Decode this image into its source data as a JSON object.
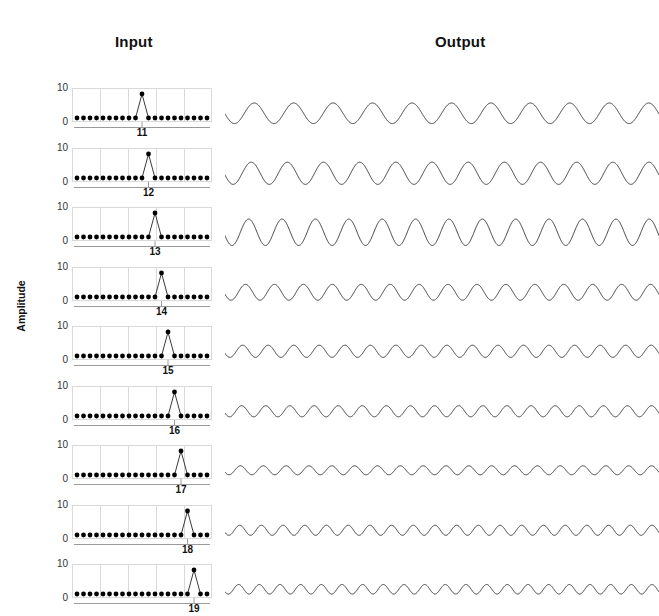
{
  "figure": {
    "width": 659,
    "height": 582,
    "background": "#ffffff",
    "line_color": "#3a3a3a",
    "marker_color": "#000000",
    "grid_color": "#d9d9d9",
    "axis_color": "#9a9a9a"
  },
  "headers": {
    "input": "Input",
    "output": "Output"
  },
  "axis": {
    "ylabel": "Amplitude",
    "yticks": [
      "10",
      "0"
    ],
    "ymin": 0,
    "ymax": 10
  },
  "chart_data": {
    "type": "line",
    "title": "",
    "subtitle": "",
    "xlabel": "",
    "ylabel": "Amplitude",
    "ylim": [
      0,
      10
    ],
    "grid": true,
    "legend": null,
    "n_rows": 9,
    "input_n_samples": 21,
    "input_baseline_value": 0,
    "input_spike_value": 10,
    "rows": [
      {
        "xtick_label": "11",
        "spike_index": 10,
        "input_values": [
          0,
          0,
          0,
          0,
          0,
          0,
          0,
          0,
          0,
          0,
          10,
          0,
          0,
          0,
          0,
          0,
          0,
          0,
          0,
          0,
          0
        ],
        "output": {
          "cycles": 11.0,
          "amplitude": 0.78,
          "phase": 3.2
        }
      },
      {
        "xtick_label": "12",
        "spike_index": 11,
        "input_values": [
          0,
          0,
          0,
          0,
          0,
          0,
          0,
          0,
          0,
          0,
          0,
          10,
          0,
          0,
          0,
          0,
          0,
          0,
          0,
          0,
          0
        ],
        "output": {
          "cycles": 12.0,
          "amplitude": 0.84,
          "phase": 3.3
        }
      },
      {
        "xtick_label": "13",
        "spike_index": 12,
        "input_values": [
          0,
          0,
          0,
          0,
          0,
          0,
          0,
          0,
          0,
          0,
          0,
          0,
          10,
          0,
          0,
          0,
          0,
          0,
          0,
          0,
          0
        ],
        "output": {
          "cycles": 13.0,
          "amplitude": 1.0,
          "phase": 3.4
        }
      },
      {
        "xtick_label": "14",
        "spike_index": 13,
        "input_values": [
          0,
          0,
          0,
          0,
          0,
          0,
          0,
          0,
          0,
          0,
          0,
          0,
          0,
          10,
          0,
          0,
          0,
          0,
          0,
          0,
          0
        ],
        "output": {
          "cycles": 15.0,
          "amplitude": 0.6,
          "phase": 3.4
        }
      },
      {
        "xtick_label": "15",
        "spike_index": 14,
        "input_values": [
          0,
          0,
          0,
          0,
          0,
          0,
          0,
          0,
          0,
          0,
          0,
          0,
          0,
          0,
          10,
          0,
          0,
          0,
          0,
          0,
          0
        ],
        "output": {
          "cycles": 17.0,
          "amplitude": 0.46,
          "phase": 3.5
        }
      },
      {
        "xtick_label": "16",
        "spike_index": 15,
        "input_values": [
          0,
          0,
          0,
          0,
          0,
          0,
          0,
          0,
          0,
          0,
          0,
          0,
          0,
          0,
          0,
          10,
          0,
          0,
          0,
          0,
          0
        ],
        "output": {
          "cycles": 18.0,
          "amplitude": 0.42,
          "phase": 3.5
        }
      },
      {
        "xtick_label": "17",
        "spike_index": 16,
        "input_values": [
          0,
          0,
          0,
          0,
          0,
          0,
          0,
          0,
          0,
          0,
          0,
          0,
          0,
          0,
          0,
          0,
          10,
          0,
          0,
          0,
          0
        ],
        "output": {
          "cycles": 19.0,
          "amplitude": 0.34,
          "phase": 3.6
        }
      },
      {
        "xtick_label": "18",
        "spike_index": 17,
        "input_values": [
          0,
          0,
          0,
          0,
          0,
          0,
          0,
          0,
          0,
          0,
          0,
          0,
          0,
          0,
          0,
          0,
          0,
          10,
          0,
          0,
          0
        ],
        "output": {
          "cycles": 20.0,
          "amplitude": 0.38,
          "phase": 3.6
        }
      },
      {
        "xtick_label": "19",
        "spike_index": 18,
        "input_values": [
          0,
          0,
          0,
          0,
          0,
          0,
          0,
          0,
          0,
          0,
          0,
          0,
          0,
          0,
          0,
          0,
          0,
          0,
          10,
          0,
          0
        ],
        "output": {
          "cycles": 21.0,
          "amplitude": 0.36,
          "phase": 3.7
        }
      }
    ]
  }
}
